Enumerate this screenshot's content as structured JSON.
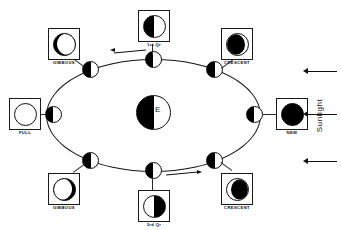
{
  "diagram": {
    "earth": {
      "label": "E"
    },
    "sunlight": {
      "label": "Sunlight",
      "arrow_count": 3,
      "direction": "left"
    },
    "orbit": {
      "direction": "counterclockwise",
      "arrow_top": "left",
      "arrow_bottom": "right"
    },
    "phases": [
      {
        "id": "first-quarter",
        "caption": "1st Qr",
        "disc": "q1",
        "position": "top-center"
      },
      {
        "id": "waning-gibbous",
        "caption": "GIBBOUS",
        "disc": "gib-left",
        "position": "top-left"
      },
      {
        "id": "waning-crescent",
        "caption": "CRESCENT",
        "disc": "cres-right",
        "position": "top-right"
      },
      {
        "id": "full-moon",
        "caption": "FULL",
        "disc": "full",
        "position": "left"
      },
      {
        "id": "new-moon",
        "caption": "NEW",
        "disc": "new",
        "position": "right"
      },
      {
        "id": "waxing-gibbous",
        "caption": "GIBBOUS",
        "disc": "gib-right",
        "position": "bottom-left"
      },
      {
        "id": "third-quarter",
        "caption": "3rd Qr",
        "disc": "q3",
        "position": "bottom-center"
      },
      {
        "id": "waxing-crescent",
        "caption": "CRESCENT",
        "disc": "cres-left",
        "position": "bottom-right"
      }
    ],
    "colors": {
      "lit": "#ffffff",
      "dark": "#000000",
      "stroke": "#111111",
      "background": "#ffffff"
    }
  }
}
